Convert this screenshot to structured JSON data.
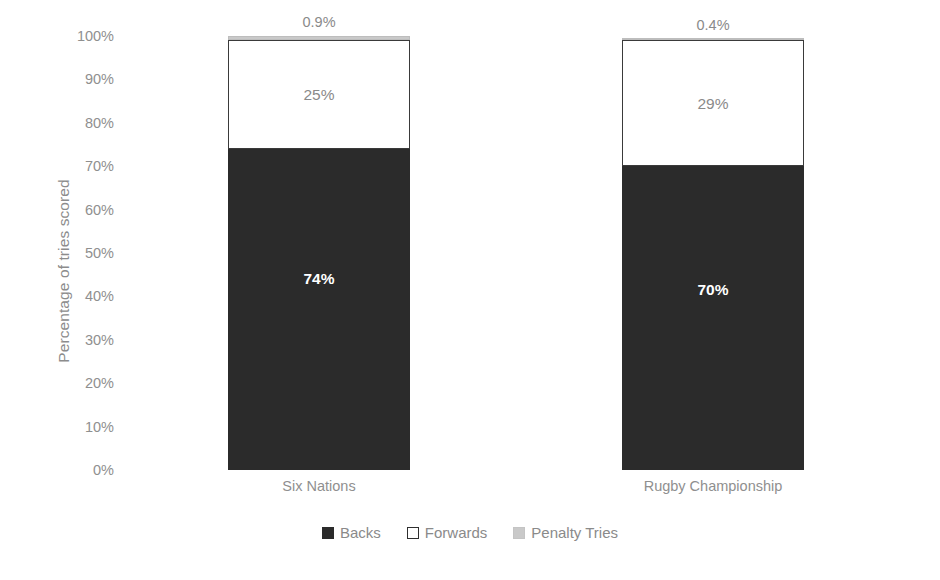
{
  "chart_data": {
    "type": "bar",
    "subtype": "100% stacked column",
    "title": "",
    "xlabel": "",
    "ylabel": "Percentage of tries scored",
    "ylim": [
      0,
      100
    ],
    "grid": false,
    "legend_position": "bottom",
    "categories": [
      "Six Nations",
      "Rugby Championship"
    ],
    "series": [
      {
        "name": "Backs",
        "color": "#2b2b2b",
        "values": [
          74,
          70
        ],
        "labels": [
          "74%",
          "70%"
        ]
      },
      {
        "name": "Forwards",
        "color": "#ffffff",
        "values": [
          25,
          29
        ],
        "labels": [
          "25%",
          "29%"
        ]
      },
      {
        "name": "Penalty Tries",
        "color": "#c9c9c9",
        "values": [
          0.9,
          0.4
        ],
        "labels": [
          "0.9%",
          "0.4%"
        ]
      }
    ],
    "y_ticks": [
      "0%",
      "10%",
      "20%",
      "30%",
      "40%",
      "50%",
      "60%",
      "70%",
      "80%",
      "90%",
      "100%"
    ],
    "y_tick_values": [
      0,
      10,
      20,
      30,
      40,
      50,
      60,
      70,
      80,
      90,
      100
    ]
  },
  "axis": {
    "y_title": "Percentage of tries scored"
  },
  "legend": {
    "items": [
      {
        "label": "Backs",
        "swatch": "black-filled-square-icon"
      },
      {
        "label": "Forwards",
        "swatch": "white-outlined-square-icon"
      },
      {
        "label": "Penalty Tries",
        "swatch": "gray-filled-square-icon"
      }
    ]
  }
}
